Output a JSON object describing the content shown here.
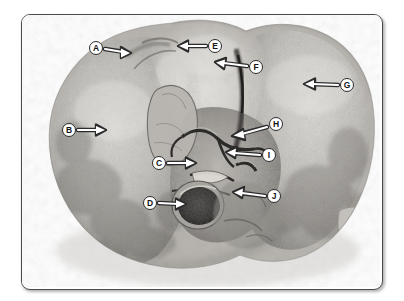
{
  "figure": {
    "kind": "anatomical-photograph",
    "rendering": "grayscale photograph",
    "frame": {
      "border_color": "#4a4a4a",
      "background_color": "#ffffff",
      "corner_radius_px": 9,
      "x": 21,
      "y": 14,
      "width": 360,
      "height": 274
    },
    "callout_style": {
      "bubble_fill": "#ffffff",
      "bubble_border": "#2b2b2b",
      "letter_color": "#141414",
      "arrow_color": "#ffffff",
      "arrow_outline": "#2b2b2b",
      "bubble_diameter_px": 14
    },
    "labels": [
      {
        "id": "A",
        "letter": "A",
        "cx": 96,
        "cy": 48,
        "arrow_dir": "right",
        "tip_x": 131,
        "tip_y": 53,
        "target": "upper-left-region-notch"
      },
      {
        "id": "B",
        "letter": "B",
        "cx": 69,
        "cy": 130,
        "arrow_dir": "right",
        "tip_x": 106,
        "tip_y": 130,
        "target": "left-lobe-surface"
      },
      {
        "id": "C",
        "letter": "C",
        "cx": 159,
        "cy": 163,
        "arrow_dir": "right",
        "tip_x": 196,
        "tip_y": 163,
        "target": "central-ridge-structure"
      },
      {
        "id": "D",
        "letter": "D",
        "cx": 150,
        "cy": 203,
        "arrow_dir": "right",
        "tip_x": 186,
        "tip_y": 204,
        "target": "cut-vessel-opening"
      },
      {
        "id": "E",
        "letter": "E",
        "cx": 215,
        "cy": 46,
        "arrow_dir": "left",
        "tip_x": 178,
        "tip_y": 46,
        "target": "superior-lobe-area"
      },
      {
        "id": "F",
        "letter": "F",
        "cx": 256,
        "cy": 67,
        "arrow_dir": "left",
        "tip_x": 215,
        "tip_y": 63,
        "target": "deep-fissure"
      },
      {
        "id": "G",
        "letter": "G",
        "cx": 347,
        "cy": 85,
        "arrow_dir": "left",
        "tip_x": 304,
        "tip_y": 84,
        "target": "right-lobe-surface"
      },
      {
        "id": "H",
        "letter": "H",
        "cx": 276,
        "cy": 124,
        "arrow_dir": "left-down",
        "tip_x": 232,
        "tip_y": 136,
        "target": "hilar-vessel-upper"
      },
      {
        "id": "I",
        "letter": "I",
        "cx": 269,
        "cy": 155,
        "arrow_dir": "left",
        "tip_x": 226,
        "tip_y": 153,
        "target": "hilar-vessel-lower"
      },
      {
        "id": "J",
        "letter": "J",
        "cx": 274,
        "cy": 196,
        "arrow_dir": "left",
        "tip_x": 233,
        "tip_y": 193,
        "target": "lower-central-mass"
      }
    ]
  }
}
